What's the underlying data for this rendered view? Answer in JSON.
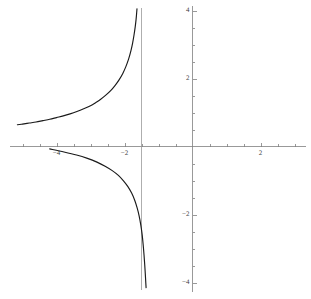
{
  "chart_data": {
    "type": "line",
    "title": "",
    "subtitle": "",
    "xlabel": "",
    "ylabel": "",
    "xlim": [
      -5.2,
      3.5
    ],
    "ylim": [
      -4.3,
      4.3
    ],
    "grid": false,
    "legend": null,
    "x_ticks_labeled": [
      {
        "value": -4,
        "label": "-4"
      },
      {
        "value": -2,
        "label": "-2"
      },
      {
        "value": 2,
        "label": "2"
      }
    ],
    "y_ticks_labeled": [
      {
        "value": 4,
        "label": "4"
      },
      {
        "value": 2,
        "label": "2"
      },
      {
        "value": -2,
        "label": "-2"
      },
      {
        "value": -4,
        "label": "-4"
      }
    ],
    "x_ticks_minor": [
      -5,
      -4.5,
      -4,
      -3.5,
      -3,
      -2.5,
      -2,
      -1.5,
      -1,
      -0.5,
      0.5,
      1,
      1.5,
      2,
      2.5,
      3
    ],
    "y_ticks_minor": [
      4,
      3.5,
      3,
      2.5,
      2,
      1.5,
      1,
      0.5,
      -0.5,
      -1,
      -1.5,
      -2,
      -2.5,
      -3,
      -3.5,
      -4
    ],
    "asymptotes": {
      "vertical": [
        -1.5
      ],
      "horizontal": []
    },
    "annotations": [],
    "series": [
      {
        "name": "branch-left",
        "color": "#1a1a1a",
        "points": [
          [
            -5.15,
            0.64
          ],
          [
            -5.0,
            0.66
          ],
          [
            -4.8,
            0.69
          ],
          [
            -4.6,
            0.72
          ],
          [
            -4.4,
            0.76
          ],
          [
            -4.2,
            0.8
          ],
          [
            -4.0,
            0.85
          ],
          [
            -3.8,
            0.9
          ],
          [
            -3.6,
            0.96
          ],
          [
            -3.4,
            1.03
          ],
          [
            -3.2,
            1.11
          ],
          [
            -3.0,
            1.2
          ],
          [
            -2.85,
            1.29
          ],
          [
            -2.7,
            1.39
          ],
          [
            -2.55,
            1.51
          ],
          [
            -2.4,
            1.65
          ],
          [
            -2.28,
            1.79
          ],
          [
            -2.16,
            1.96
          ],
          [
            -2.05,
            2.15
          ],
          [
            -1.96,
            2.35
          ],
          [
            -1.88,
            2.57
          ],
          [
            -1.81,
            2.82
          ],
          [
            -1.76,
            3.05
          ],
          [
            -1.72,
            3.28
          ],
          [
            -1.685,
            3.52
          ],
          [
            -1.66,
            3.73
          ],
          [
            -1.645,
            3.9
          ],
          [
            -1.633,
            4.05
          ]
        ]
      },
      {
        "name": "branch-right",
        "color": "#1a1a1a",
        "points": [
          [
            -1.365,
            -4.15
          ],
          [
            -1.377,
            -3.95
          ],
          [
            -1.39,
            -3.72
          ],
          [
            -1.405,
            -3.48
          ],
          [
            -1.425,
            -3.2
          ],
          [
            -1.45,
            -2.9
          ],
          [
            -1.48,
            -2.6
          ],
          [
            -1.52,
            -2.31
          ],
          [
            -1.57,
            -2.04
          ],
          [
            -1.63,
            -1.8
          ],
          [
            -1.7,
            -1.58
          ],
          [
            -1.79,
            -1.37
          ],
          [
            -1.9,
            -1.18
          ],
          [
            -2.03,
            -1.01
          ],
          [
            -2.18,
            -0.85
          ],
          [
            -2.36,
            -0.71
          ],
          [
            -2.57,
            -0.58
          ],
          [
            -2.81,
            -0.46
          ],
          [
            -3.09,
            -0.35
          ],
          [
            -3.41,
            -0.25
          ],
          [
            -3.78,
            -0.16
          ],
          [
            -4.2,
            -0.07
          ]
        ]
      }
    ]
  },
  "curve": {
    "function_label": "",
    "asymptote_x": -1.5,
    "zero_crossing_x": -0.1,
    "left_branch_x_start": -5.15,
    "left_branch_y_top": 4.05,
    "right_branch_y_bottom": -4.15,
    "right_branch_x_end": 3.35,
    "right_branch_y_end": 0.42
  },
  "axes": {
    "x_axis_name": "x-axis",
    "y_axis_name": "y-axis",
    "axis_color": "#808080",
    "curve_color": "#1a1a1a",
    "background_color": "#ffffff"
  }
}
